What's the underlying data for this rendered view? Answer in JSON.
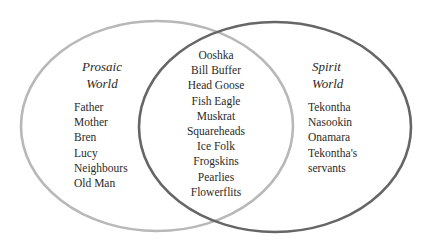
{
  "diagram": {
    "type": "venn",
    "colors": {
      "left_circle": "#b8b8b8",
      "right_circle": "#666666",
      "text": "#2a2a2a"
    },
    "left": {
      "title_line1": "Prosaic",
      "title_line2": "World",
      "items": [
        "Father",
        "Mother",
        "Bren",
        "Lucy",
        "Neighbours",
        "Old Man"
      ]
    },
    "intersection": {
      "items": [
        "Ooshka",
        "Bill Buffer",
        "Head Goose",
        "Fish Eagle",
        "Muskrat",
        "Squareheads",
        "Ice Folk",
        "Frogskins",
        "Pearlies",
        "Flowerflits"
      ]
    },
    "right": {
      "title_line1": "Spirit",
      "title_line2": "World",
      "items": [
        "Tekontha",
        "Nasookin",
        "Onamara",
        "Tekontha's",
        "servants"
      ]
    }
  }
}
